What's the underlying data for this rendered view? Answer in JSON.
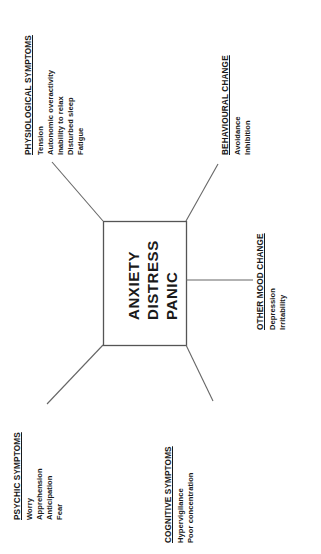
{
  "diagram": {
    "type": "radial-concept-map",
    "center": {
      "lines": [
        "ANXIETY",
        "DISTRESS",
        "PANIC"
      ]
    },
    "groups": [
      {
        "id": "physiological-symptoms",
        "heading": "PHYSIOLOGICAL SYMPTOMS",
        "items": [
          "Tension",
          "Autonomic overactivity",
          "Inability to relax",
          "Disturbed sleep",
          "Fatigue"
        ]
      },
      {
        "id": "behavioural-change",
        "heading": "BEHAVIOURAL CHANGE",
        "items": [
          "Avoidance",
          "Inhibition"
        ]
      },
      {
        "id": "other-mood-change",
        "heading": "OTHER MOOD CHANGE",
        "items": [
          "Depression",
          "Irritability"
        ]
      },
      {
        "id": "psychic-symptoms",
        "heading": "PSYCHIC SYMPTOMS",
        "items": [
          "Worry",
          "Apprehension",
          "Anticipation",
          "Fear"
        ]
      },
      {
        "id": "cognitive-symptoms",
        "heading": "COGNITIVE SYMPTOMS",
        "items": [
          "Hypervigilance",
          "Poor concentration"
        ]
      }
    ],
    "colors": {
      "line": "#555555",
      "text": "#1a1a1a",
      "background": "#ffffff"
    }
  }
}
